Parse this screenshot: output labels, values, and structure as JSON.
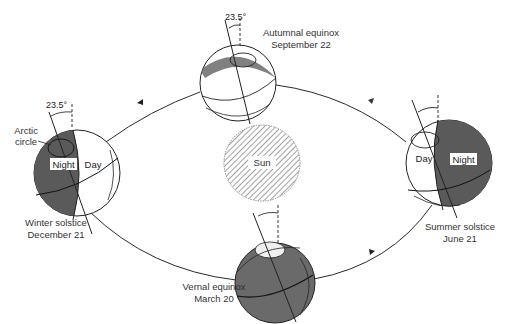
{
  "diagram": {
    "type": "earth-orbit-seasons",
    "tilt_label": "23.5°",
    "sun": {
      "label": "Sun"
    },
    "positions": {
      "autumnal": {
        "line1": "Autumnal equinox",
        "line2": "September 22"
      },
      "winter": {
        "line1": "Winter solstice",
        "line2": "December 21",
        "night": "Night",
        "day": "Day",
        "arctic1": "Arctic",
        "arctic2": "circle"
      },
      "summer": {
        "line1": "Summer solstice",
        "line2": "June 21",
        "night": "Night",
        "day": "Day"
      },
      "vernal": {
        "line1": "Vernal equinox",
        "line2": "March 20"
      }
    },
    "colors": {
      "shade": "#5a5a5a",
      "line": "#222222",
      "hatch": "#888888",
      "accent": "#c0392b"
    }
  }
}
